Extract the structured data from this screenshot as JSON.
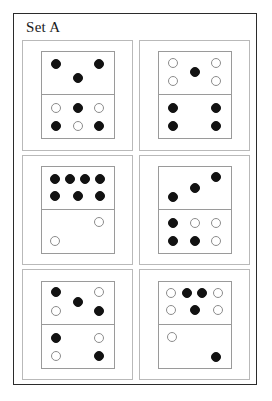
{
  "title": "Set A",
  "colors": {
    "frame_border": "#2b2b2b",
    "card_border": "#b9b9b9",
    "domino_border": "#9a9a9a",
    "pip_filled": "#121212",
    "pip_open_border": "#8c8c8c",
    "background": "#ffffff"
  },
  "dominoes": [
    {
      "name": "domino-1",
      "top": {
        "filled_count": 3,
        "open_count": 0,
        "pips": [
          {
            "x": 20,
            "y": 27,
            "fill": "filled"
          },
          {
            "x": 80,
            "y": 27,
            "fill": "filled"
          },
          {
            "x": 50,
            "y": 62,
            "fill": "filled"
          }
        ]
      },
      "bottom": {
        "filled_count": 3,
        "open_count": 3,
        "pips": [
          {
            "x": 20,
            "y": 30,
            "fill": "open"
          },
          {
            "x": 50,
            "y": 30,
            "fill": "filled"
          },
          {
            "x": 80,
            "y": 30,
            "fill": "open"
          },
          {
            "x": 20,
            "y": 72,
            "fill": "filled"
          },
          {
            "x": 50,
            "y": 72,
            "fill": "open"
          },
          {
            "x": 80,
            "y": 72,
            "fill": "filled"
          }
        ]
      }
    },
    {
      "name": "domino-2",
      "top": {
        "filled_count": 1,
        "open_count": 4,
        "pips": [
          {
            "x": 20,
            "y": 25,
            "fill": "open"
          },
          {
            "x": 80,
            "y": 25,
            "fill": "open"
          },
          {
            "x": 50,
            "y": 47,
            "fill": "filled"
          },
          {
            "x": 20,
            "y": 68,
            "fill": "open"
          },
          {
            "x": 80,
            "y": 68,
            "fill": "open"
          }
        ]
      },
      "bottom": {
        "filled_count": 4,
        "open_count": 0,
        "pips": [
          {
            "x": 20,
            "y": 30,
            "fill": "filled"
          },
          {
            "x": 80,
            "y": 30,
            "fill": "filled"
          },
          {
            "x": 20,
            "y": 72,
            "fill": "filled"
          },
          {
            "x": 80,
            "y": 72,
            "fill": "filled"
          }
        ]
      }
    },
    {
      "name": "domino-3",
      "top": {
        "filled_count": 7,
        "open_count": 0,
        "pips": [
          {
            "x": 19,
            "y": 28,
            "fill": "filled"
          },
          {
            "x": 39,
            "y": 28,
            "fill": "filled"
          },
          {
            "x": 60,
            "y": 28,
            "fill": "filled"
          },
          {
            "x": 81,
            "y": 28,
            "fill": "filled"
          },
          {
            "x": 19,
            "y": 68,
            "fill": "filled"
          },
          {
            "x": 50,
            "y": 68,
            "fill": "filled"
          },
          {
            "x": 81,
            "y": 68,
            "fill": "filled"
          }
        ]
      },
      "bottom": {
        "filled_count": 0,
        "open_count": 2,
        "pips": [
          {
            "x": 80,
            "y": 28,
            "fill": "open"
          },
          {
            "x": 19,
            "y": 72,
            "fill": "open"
          }
        ]
      }
    },
    {
      "name": "domino-4",
      "top": {
        "filled_count": 3,
        "open_count": 0,
        "pips": [
          {
            "x": 20,
            "y": 72,
            "fill": "filled"
          },
          {
            "x": 50,
            "y": 50,
            "fill": "filled"
          },
          {
            "x": 80,
            "y": 25,
            "fill": "filled"
          }
        ]
      },
      "bottom": {
        "filled_count": 3,
        "open_count": 3,
        "pips": [
          {
            "x": 20,
            "y": 30,
            "fill": "filled"
          },
          {
            "x": 50,
            "y": 30,
            "fill": "open"
          },
          {
            "x": 80,
            "y": 30,
            "fill": "open"
          },
          {
            "x": 20,
            "y": 72,
            "fill": "filled"
          },
          {
            "x": 50,
            "y": 72,
            "fill": "filled"
          },
          {
            "x": 80,
            "y": 72,
            "fill": "open"
          }
        ]
      }
    },
    {
      "name": "domino-5",
      "top": {
        "filled_count": 3,
        "open_count": 2,
        "pips": [
          {
            "x": 20,
            "y": 25,
            "fill": "filled"
          },
          {
            "x": 80,
            "y": 25,
            "fill": "open"
          },
          {
            "x": 50,
            "y": 48,
            "fill": "filled"
          },
          {
            "x": 20,
            "y": 70,
            "fill": "open"
          },
          {
            "x": 80,
            "y": 70,
            "fill": "filled"
          }
        ]
      },
      "bottom": {
        "filled_count": 2,
        "open_count": 2,
        "pips": [
          {
            "x": 20,
            "y": 30,
            "fill": "filled"
          },
          {
            "x": 80,
            "y": 30,
            "fill": "open"
          },
          {
            "x": 20,
            "y": 72,
            "fill": "open"
          },
          {
            "x": 80,
            "y": 72,
            "fill": "filled"
          }
        ]
      }
    },
    {
      "name": "domino-6",
      "top": {
        "filled_count": 3,
        "open_count": 4,
        "pips": [
          {
            "x": 17,
            "y": 28,
            "fill": "open"
          },
          {
            "x": 39,
            "y": 28,
            "fill": "filled"
          },
          {
            "x": 61,
            "y": 28,
            "fill": "filled"
          },
          {
            "x": 83,
            "y": 28,
            "fill": "open"
          },
          {
            "x": 17,
            "y": 68,
            "fill": "open"
          },
          {
            "x": 50,
            "y": 68,
            "fill": "filled"
          },
          {
            "x": 83,
            "y": 68,
            "fill": "open"
          }
        ]
      },
      "bottom": {
        "filled_count": 1,
        "open_count": 1,
        "pips": [
          {
            "x": 19,
            "y": 28,
            "fill": "open"
          },
          {
            "x": 80,
            "y": 76,
            "fill": "filled"
          }
        ]
      }
    }
  ]
}
